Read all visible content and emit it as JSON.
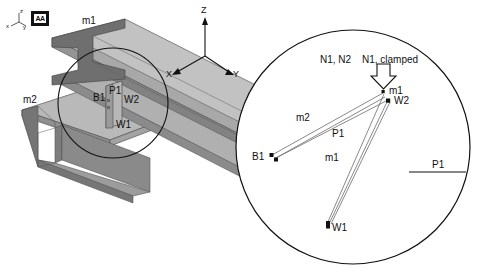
{
  "figure": {
    "background": "#ffffff",
    "stroke": "#111111"
  },
  "view_triad_small": {
    "name": "orientation-triad",
    "z_label": "z",
    "x_label": "x",
    "y_label": "y"
  },
  "view_badge": {
    "label": "AA"
  },
  "global_axes": {
    "z_label": "Z",
    "x_label": "X",
    "y_label": "Y"
  },
  "model": {
    "beam_top_label": "m1",
    "beam_lower_label": "m2",
    "colors": {
      "beam_top_face": "#b3b3b3",
      "beam_side_face": "#8c8c8c",
      "beam_dark_face": "#6e6e6e",
      "beam_light_face": "#c8c8c8",
      "outline": "#4a4a4a"
    }
  },
  "detail_callout": {
    "name": "detail-circle",
    "labels": [
      {
        "id": "b1",
        "text": "B1"
      },
      {
        "id": "p1",
        "text": "P1"
      },
      {
        "id": "w2",
        "text": "W2"
      },
      {
        "id": "w1",
        "text": "W1"
      }
    ]
  },
  "detail_view": {
    "name": "enlarged-detail-circle",
    "annotations": {
      "node_set_1": "N1, N2",
      "node_set_2": "N1, clamped",
      "connector_m1_top": "m1",
      "connector_w2": "W2",
      "connector_m2": "m2",
      "connector_p1": "P1",
      "connector_m1_lower": "m1",
      "node_b1": "B1",
      "node_w1": "W1",
      "legend_p1": "P1"
    },
    "nodes": [
      {
        "id": "top",
        "label": "m1",
        "x": 384,
        "y": 92
      },
      {
        "id": "w2",
        "label": "W2",
        "x": 388,
        "y": 101
      },
      {
        "id": "b1",
        "label": "B1",
        "x": 272,
        "y": 156
      },
      {
        "id": "w1",
        "label": "W1",
        "x": 328,
        "y": 225
      }
    ],
    "connectors": [
      {
        "label": "m2",
        "from": "top",
        "to": "b1"
      },
      {
        "label": "P1",
        "from": "w2",
        "to": "b1"
      },
      {
        "label": "m1",
        "from": "w2",
        "to": "w1"
      },
      {
        "label": "P1",
        "from": "top",
        "to": "w1"
      }
    ]
  }
}
